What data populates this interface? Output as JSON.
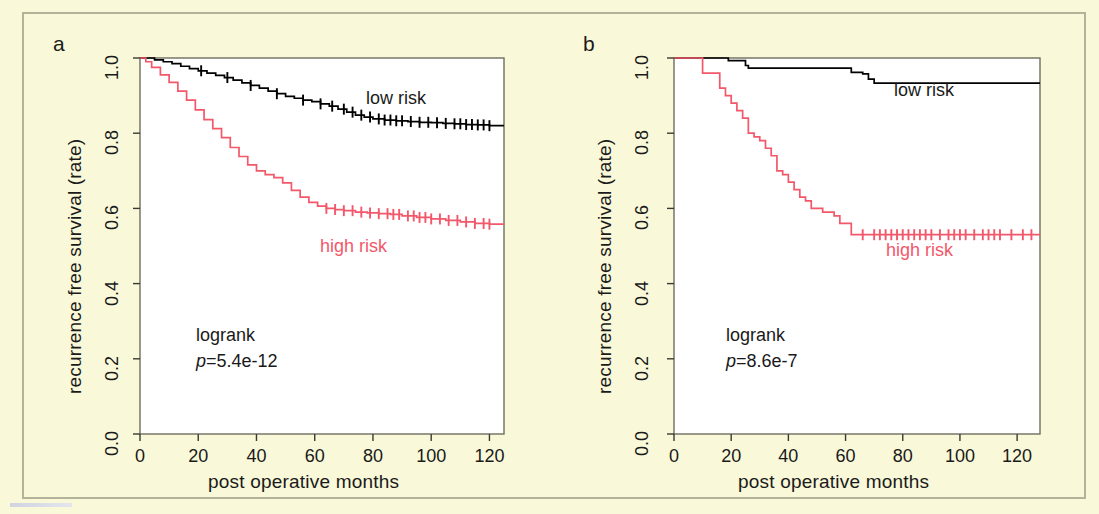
{
  "figure": {
    "background_color": "#f9f8d9",
    "border_color": "#b3b39a",
    "plot_background": "#ffffff",
    "low_risk_color": "#000000",
    "high_risk_color": "#f2586a"
  },
  "panels": [
    {
      "id": "a",
      "label": "a",
      "stats": {
        "test": "logrank",
        "p_prefix": "p",
        "p_value": "=5.4e-12"
      },
      "legend": {
        "low": "low risk",
        "high": "high risk"
      }
    },
    {
      "id": "b",
      "label": "b",
      "stats": {
        "test": "logrank",
        "p_prefix": "p",
        "p_value": "=8.6e-7"
      },
      "legend": {
        "low": "low risk",
        "high": "high risk"
      }
    }
  ],
  "axes": {
    "xlabel": "post operative months",
    "ylabel": "recurrence free survival  (rate)",
    "xticks": [
      "0",
      "20",
      "40",
      "60",
      "80",
      "100",
      "120"
    ],
    "yticks": [
      "0.0",
      "0.2",
      "0.4",
      "0.6",
      "0.8",
      "1.0"
    ]
  },
  "chart_data": [
    {
      "type": "line",
      "panel": "a",
      "title": "",
      "xlabel": "post operative months",
      "ylabel": "recurrence free survival  (rate)",
      "xlim": [
        0,
        125
      ],
      "ylim": [
        0.0,
        1.0
      ],
      "xticks": [
        0,
        20,
        40,
        60,
        80,
        100,
        120
      ],
      "yticks": [
        0.0,
        0.2,
        0.4,
        0.6,
        0.8,
        1.0
      ],
      "grid": false,
      "legend_position": "inside-right",
      "annotations": [
        "logrank",
        "p=5.4e-12"
      ],
      "series": [
        {
          "name": "low risk",
          "color": "#000000",
          "step": "post",
          "x": [
            0,
            2,
            5,
            8,
            11,
            14,
            17,
            20,
            23,
            26,
            29,
            32,
            35,
            38,
            41,
            44,
            47,
            50,
            53,
            56,
            59,
            62,
            65,
            68,
            71,
            74,
            77,
            80,
            84,
            88,
            92,
            96,
            100,
            104,
            108,
            112,
            116,
            120
          ],
          "y": [
            1.0,
            1.0,
            0.995,
            0.99,
            0.985,
            0.978,
            0.972,
            0.966,
            0.96,
            0.954,
            0.948,
            0.941,
            0.934,
            0.927,
            0.92,
            0.912,
            0.905,
            0.898,
            0.893,
            0.888,
            0.884,
            0.878,
            0.872,
            0.864,
            0.856,
            0.848,
            0.843,
            0.838,
            0.835,
            0.833,
            0.831,
            0.829,
            0.828,
            0.826,
            0.825,
            0.823,
            0.822,
            0.82
          ],
          "censor_x": [
            21,
            30,
            38,
            47,
            56,
            62,
            66,
            70,
            73,
            76,
            79,
            82,
            84,
            86,
            88,
            90,
            93,
            96,
            99,
            102,
            105,
            108,
            110,
            112,
            114,
            116,
            118,
            120
          ],
          "final_value": 0.82
        },
        {
          "name": "high risk",
          "color": "#f2586a",
          "step": "post",
          "x": [
            0,
            2,
            4,
            7,
            10,
            13,
            16,
            19,
            22,
            25,
            28,
            31,
            34,
            37,
            40,
            43,
            46,
            49,
            52,
            55,
            58,
            61,
            64,
            67,
            70,
            74,
            78,
            82,
            86,
            90,
            95,
            100,
            105,
            110,
            115,
            120
          ],
          "y": [
            1.0,
            0.99,
            0.975,
            0.955,
            0.935,
            0.912,
            0.888,
            0.862,
            0.836,
            0.812,
            0.788,
            0.762,
            0.738,
            0.716,
            0.7,
            0.69,
            0.682,
            0.668,
            0.648,
            0.63,
            0.616,
            0.606,
            0.6,
            0.597,
            0.594,
            0.59,
            0.588,
            0.586,
            0.584,
            0.58,
            0.576,
            0.572,
            0.568,
            0.564,
            0.56,
            0.558
          ],
          "censor_x": [
            64,
            67,
            70,
            73,
            76,
            79,
            82,
            85,
            87,
            89,
            92,
            94,
            96,
            98,
            100,
            103,
            106,
            109,
            112,
            115,
            118,
            120
          ],
          "final_value": 0.56
        }
      ]
    },
    {
      "type": "line",
      "panel": "b",
      "title": "",
      "xlabel": "post operative months",
      "ylabel": "recurrence free survival  (rate)",
      "xlim": [
        0,
        128
      ],
      "ylim": [
        0.0,
        1.0
      ],
      "xticks": [
        0,
        20,
        40,
        60,
        80,
        100,
        120
      ],
      "yticks": [
        0.0,
        0.2,
        0.4,
        0.6,
        0.8,
        1.0
      ],
      "grid": false,
      "legend_position": "inside-right",
      "annotations": [
        "logrank",
        "p=8.6e-7"
      ],
      "series": [
        {
          "name": "low risk",
          "color": "#000000",
          "step": "post",
          "x": [
            0,
            18,
            19,
            24,
            25,
            26,
            60,
            62,
            66,
            68,
            70,
            126
          ],
          "y": [
            1.0,
            1.0,
            0.993,
            0.993,
            0.98,
            0.973,
            0.973,
            0.962,
            0.958,
            0.944,
            0.933,
            0.933
          ],
          "censor_x": [],
          "final_value": 0.93
        },
        {
          "name": "high risk",
          "color": "#f2586a",
          "step": "post",
          "x": [
            0,
            9,
            10,
            14,
            16,
            18,
            20,
            22,
            24,
            26,
            28,
            30,
            32,
            34,
            36,
            38,
            40,
            42,
            44,
            46,
            48,
            52,
            56,
            58,
            62,
            126
          ],
          "y": [
            1.0,
            1.0,
            0.96,
            0.96,
            0.92,
            0.9,
            0.88,
            0.86,
            0.84,
            0.8,
            0.79,
            0.78,
            0.76,
            0.74,
            0.7,
            0.69,
            0.67,
            0.65,
            0.63,
            0.62,
            0.6,
            0.59,
            0.58,
            0.56,
            0.53,
            0.53
          ],
          "censor_x": [
            66,
            70,
            72,
            74,
            76,
            78,
            80,
            82,
            84,
            86,
            88,
            90,
            93,
            96,
            98,
            100,
            102,
            105,
            108,
            110,
            112,
            114,
            118,
            122,
            125
          ],
          "final_value": 0.53
        }
      ]
    }
  ]
}
